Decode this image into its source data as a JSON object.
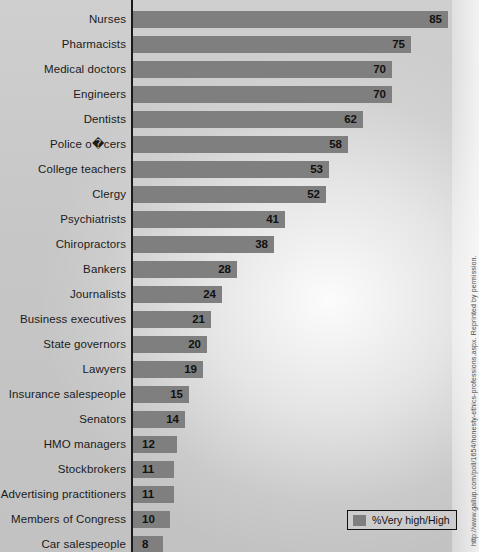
{
  "chart_data": {
    "type": "bar",
    "orientation": "horizontal",
    "title": "",
    "xlabel": "",
    "ylabel": "",
    "xlim": [
      0,
      85
    ],
    "grid": false,
    "legend_position": "bottom-right",
    "value_suffix": "",
    "categories": [
      "Nurses",
      "Pharmacists",
      "Medical doctors",
      "Engineers",
      "Dentists",
      "Police o�cers",
      "College teachers",
      "Clergy",
      "Psychiatrists",
      "Chiropractors",
      "Bankers",
      "Journalists",
      "Business executives",
      "State governors",
      "Lawyers",
      "Insurance salespeople",
      "Senators",
      "HMO managers",
      "Stockbrokers",
      "Advertising practitioners",
      "Members of Congress",
      "Car salespeople"
    ],
    "values": [
      85,
      75,
      70,
      70,
      62,
      58,
      53,
      52,
      41,
      38,
      28,
      24,
      21,
      20,
      19,
      15,
      14,
      12,
      11,
      11,
      10,
      8
    ],
    "series": [
      {
        "name": "%Very high/High",
        "color": "#7f7f7f",
        "values": [
          85,
          75,
          70,
          70,
          62,
          58,
          53,
          52,
          41,
          38,
          28,
          24,
          21,
          20,
          19,
          15,
          14,
          12,
          11,
          11,
          10,
          8
        ]
      }
    ]
  },
  "legend": {
    "label": "%Very high/High",
    "swatch_color": "#7f7f7f"
  },
  "source": {
    "text": "http://www.gallup.com/poll/1654/honesty-ethics-professions.aspx. Reprinted by permission."
  },
  "colors": {
    "bar": "#7f7f7f",
    "axis": "#1a1a1a",
    "label_text": "#1b1b1b",
    "value_text": "#111111",
    "background": "#c6c6c6"
  }
}
